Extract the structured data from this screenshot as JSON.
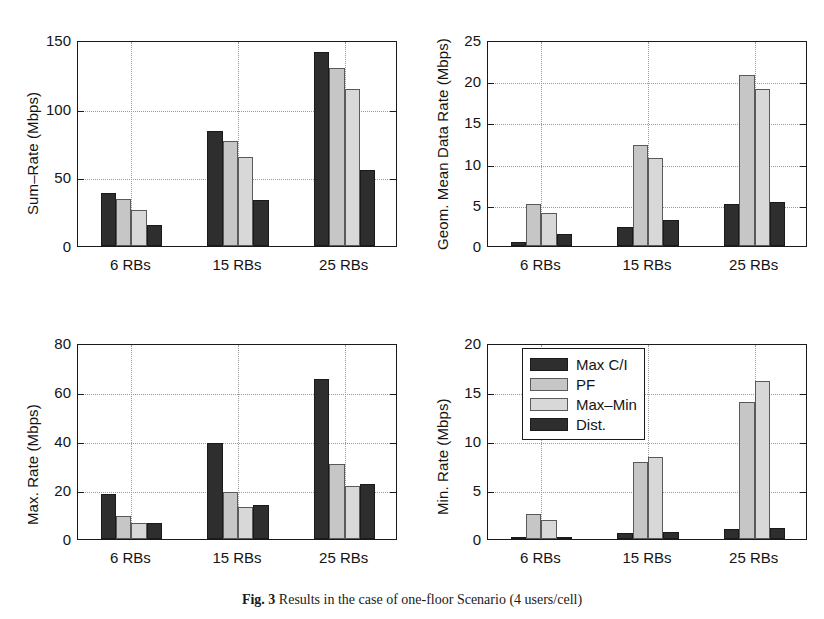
{
  "figure": {
    "caption_label": "Fig. 3",
    "caption_text": "Results in the case of one-floor Scenario (4 users/cell)",
    "series_names": [
      "Max C/I",
      "PF",
      "Max–Min",
      "Dist."
    ],
    "series_colors": [
      "#2e2e2e",
      "#c6c6c6",
      "#d8d8d8",
      "#2e2e2e"
    ],
    "categories": [
      "6 RBs",
      "15 RBs",
      "25 RBs"
    ]
  },
  "legend": {
    "position": "top-left-of-bottom-right-panel",
    "entries": [
      {
        "label": "Max C/I",
        "color": "#2e2e2e"
      },
      {
        "label": "PF",
        "color": "#c6c6c6"
      },
      {
        "label": "Max–Min",
        "color": "#d8d8d8"
      },
      {
        "label": "Dist.",
        "color": "#2e2e2e"
      }
    ]
  },
  "chart_data": [
    {
      "id": "sum-rate",
      "type": "bar",
      "title": "",
      "xlabel": "",
      "ylabel": "Sum–Rate (Mbps)",
      "categories": [
        "6 RBs",
        "15 RBs",
        "25 RBs"
      ],
      "ylim": [
        0,
        150
      ],
      "yticks": [
        0,
        50,
        100,
        150
      ],
      "ytick_labels": [
        "0",
        "50",
        "100",
        "150"
      ],
      "grid": true,
      "legend": "none",
      "series": [
        {
          "name": "Max C/I",
          "values": [
            38.5,
            84.0,
            141.0
          ]
        },
        {
          "name": "PF",
          "values": [
            34.5,
            76.5,
            129.5
          ]
        },
        {
          "name": "Max–Min",
          "values": [
            26.0,
            64.5,
            114.0
          ]
        },
        {
          "name": "Dist.",
          "values": [
            15.5,
            33.5,
            55.0
          ]
        }
      ]
    },
    {
      "id": "geom-mean-data-rate",
      "type": "bar",
      "title": "",
      "xlabel": "",
      "ylabel": "Geom. Mean Data Rate (Mbps)",
      "categories": [
        "6 RBs",
        "15 RBs",
        "25 RBs"
      ],
      "ylim": [
        0,
        25
      ],
      "yticks": [
        0,
        5,
        10,
        15,
        20,
        25
      ],
      "ytick_labels": [
        "0",
        "5",
        "10",
        "15",
        "20",
        "25"
      ],
      "grid": true,
      "legend": "none",
      "series": [
        {
          "name": "Max C/I",
          "values": [
            0.5,
            2.3,
            5.1
          ]
        },
        {
          "name": "PF",
          "values": [
            5.1,
            12.2,
            20.7
          ]
        },
        {
          "name": "Max–Min",
          "values": [
            4.0,
            10.7,
            19.0
          ]
        },
        {
          "name": "Dist.",
          "values": [
            1.4,
            3.2,
            5.4
          ]
        }
      ]
    },
    {
      "id": "max-rate",
      "type": "bar",
      "title": "",
      "xlabel": "",
      "ylabel": "Max. Rate (Mbps)",
      "categories": [
        "6 RBs",
        "15 RBs",
        "25 RBs"
      ],
      "ylim": [
        0,
        80
      ],
      "yticks": [
        0,
        20,
        40,
        60,
        80
      ],
      "ytick_labels": [
        "0",
        "20",
        "40",
        "60",
        "80"
      ],
      "grid": true,
      "legend": "none",
      "series": [
        {
          "name": "Max C/I",
          "values": [
            18.5,
            39.0,
            65.5
          ]
        },
        {
          "name": "PF",
          "values": [
            9.3,
            19.0,
            30.8
          ]
        },
        {
          "name": "Max–Min",
          "values": [
            6.6,
            13.2,
            21.7
          ]
        },
        {
          "name": "Dist.",
          "values": [
            6.6,
            14.0,
            22.6
          ]
        }
      ]
    },
    {
      "id": "min-rate",
      "type": "bar",
      "title": "",
      "xlabel": "",
      "ylabel": "Min. Rate (Mbps)",
      "categories": [
        "6 RBs",
        "15 RBs",
        "25 RBs"
      ],
      "ylim": [
        0,
        20
      ],
      "yticks": [
        0,
        5,
        10,
        15,
        20
      ],
      "ytick_labels": [
        "0",
        "5",
        "10",
        "15",
        "20"
      ],
      "grid": true,
      "legend": "inside-top-left",
      "series": [
        {
          "name": "Max C/I",
          "values": [
            0.12,
            0.6,
            1.05
          ]
        },
        {
          "name": "PF",
          "values": [
            2.6,
            7.9,
            14.0
          ]
        },
        {
          "name": "Max–Min",
          "values": [
            1.9,
            8.4,
            16.1
          ]
        },
        {
          "name": "Dist.",
          "values": [
            0.25,
            0.7,
            1.15
          ]
        }
      ]
    }
  ]
}
